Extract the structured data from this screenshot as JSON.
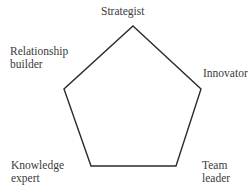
{
  "diagram": {
    "shape": "pentagon",
    "stroke_color": "#2b2b2b",
    "text_color": "#3a3a3a",
    "vertices": [
      {
        "id": "strategist",
        "label": "Strategist"
      },
      {
        "id": "innovator",
        "label": "Innovator"
      },
      {
        "id": "team-leader",
        "label": "Team\nleader"
      },
      {
        "id": "knowledge-expert",
        "label": "Knowledge\nexpert"
      },
      {
        "id": "relationship-builder",
        "label": "Relationship\nbuilder"
      }
    ]
  }
}
